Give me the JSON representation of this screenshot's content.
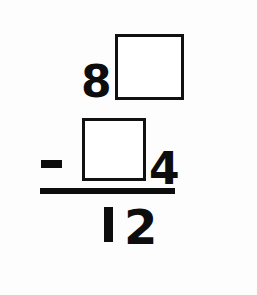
{
  "worksheet": {
    "problem_type": "vertical-subtraction-fill-in-the-blank",
    "background_color": "#ffffff",
    "ink_color": "#0d0d0d",
    "minuend_row": {
      "visible_digit": "8",
      "blank_box_label": "",
      "blank_box_icon": "empty-square-box"
    },
    "subtrahend_row": {
      "operator": "−",
      "operator_name": "minus-sign",
      "blank_box_label": "",
      "blank_box_icon": "empty-square-box",
      "visible_digit": "4"
    },
    "rule": {
      "icon": "horizontal-rule-line"
    },
    "result_row": {
      "tens_digit": "1",
      "ones_digit": "2",
      "full_value": "12"
    }
  }
}
